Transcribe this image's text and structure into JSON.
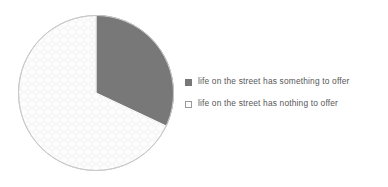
{
  "canvas": {
    "width": 388,
    "height": 187,
    "background": "#ffffff"
  },
  "colors": {
    "slice_dark": "#787878",
    "slice_light": "#fbfbfb",
    "slice_light_texture": "#f1f1f1",
    "outline": "#c9c9c9",
    "divider": "#ffffff",
    "text": "#58585a",
    "swatch_border": "#9a9a9a"
  },
  "pie": {
    "center_x": 96,
    "center_y": 93,
    "radius": 78,
    "start_angle_deg": 0,
    "rotation_note": "first slice begins at 12 o'clock and sweeps clockwise"
  },
  "legend": {
    "items": [
      {
        "label": "life on the street has something to offer",
        "swatch": "filled-square-icon",
        "color": "#787878"
      },
      {
        "label": "life on the street has nothing to offer",
        "swatch": "hollow-square-icon",
        "color": "#ffffff"
      }
    ]
  },
  "chart_data": {
    "type": "pie",
    "title": "",
    "subtitle": "",
    "xlabel": "",
    "ylabel": "",
    "grid": false,
    "legend_position": "right",
    "categories": [
      "life on the street has something to offer",
      "life on the street has nothing to offer"
    ],
    "values": [
      32,
      68
    ],
    "value_unit": "percent",
    "colors": [
      "#787878",
      "#fbfbfb"
    ],
    "slices": [
      {
        "label": "life on the street has something to offer",
        "value": 32,
        "start_angle_deg": 0,
        "end_angle_deg": 115.2,
        "color": "#787878"
      },
      {
        "label": "life on the street has nothing to offer",
        "value": 68,
        "start_angle_deg": 115.2,
        "end_angle_deg": 360,
        "color": "#fbfbfb"
      }
    ],
    "data_labels_shown": false
  }
}
